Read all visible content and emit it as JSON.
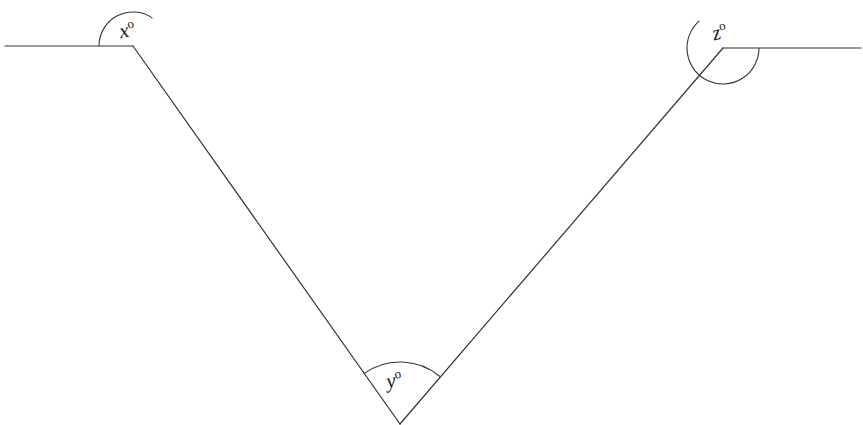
{
  "figure": {
    "type": "geometry-diagram",
    "background_color": "#ffffff",
    "stroke_color": "#333333",
    "label_color": "#1a1a1a",
    "canvas": {
      "width": 863,
      "height": 425
    }
  },
  "vertices": {
    "left": {
      "name": "left-vertex",
      "x": 133,
      "y": 46
    },
    "bottom": {
      "name": "bottom-vertex",
      "x": 400,
      "y": 424
    },
    "right": {
      "name": "right-vertex",
      "x": 723,
      "y": 48
    }
  },
  "rays": {
    "left_ray": {
      "name": "left-horizontal-ray",
      "from_x": 5,
      "from_y": 46,
      "to_x": 133,
      "to_y": 46
    },
    "right_ray": {
      "name": "right-horizontal-ray",
      "from_x": 723,
      "from_y": 48,
      "to_x": 861,
      "to_y": 48
    }
  },
  "segments": {
    "left_leg": {
      "name": "left-descending-segment",
      "from_x": 133,
      "from_y": 46,
      "to_x": 400,
      "to_y": 424
    },
    "right_leg": {
      "name": "right-ascending-segment",
      "from_x": 400,
      "from_y": 424,
      "to_x": 723,
      "to_y": 48
    }
  },
  "angles": [
    {
      "id": "x",
      "name": "angle-x",
      "label": "x",
      "degree_symbol": "o",
      "vertex": "left",
      "arc_radius": 34,
      "arc_start_deg": 180,
      "arc_end_deg": 305,
      "reflex": true
    },
    {
      "id": "y",
      "name": "angle-y",
      "label": "y",
      "degree_symbol": "o",
      "vertex": "bottom",
      "arc_radius": 62,
      "arc_start_deg": 234,
      "arc_end_deg": 310,
      "reflex": false
    },
    {
      "id": "z",
      "name": "angle-z",
      "label": "z",
      "degree_symbol": "o",
      "vertex": "right",
      "arc_radius": 36,
      "arc_start_deg": 0,
      "arc_end_deg": 229,
      "reflex": true
    }
  ]
}
